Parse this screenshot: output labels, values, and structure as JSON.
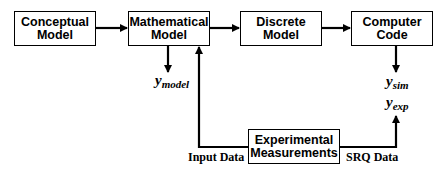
{
  "diagram": {
    "nodes": [
      {
        "id": "conceptual",
        "label": "Conceptual\nModel"
      },
      {
        "id": "mathematical",
        "label": "Mathematical\nModel"
      },
      {
        "id": "discrete",
        "label": "Discrete\nModel"
      },
      {
        "id": "computer",
        "label": "Computer\nCode"
      },
      {
        "id": "experimental",
        "label": "Experimental\nMeasurements"
      }
    ],
    "edges": [
      {
        "from": "conceptual",
        "to": "mathematical"
      },
      {
        "from": "mathematical",
        "to": "discrete"
      },
      {
        "from": "discrete",
        "to": "computer"
      },
      {
        "from": "mathematical",
        "to": "y_model"
      },
      {
        "from": "computer",
        "to": "y_sim"
      },
      {
        "from": "experimental",
        "to": "mathematical",
        "label": "Input Data"
      },
      {
        "from": "experimental",
        "to": "y_exp",
        "label": "SRQ Data"
      }
    ],
    "outputs": {
      "y_model": {
        "base": "y",
        "sub": "model"
      },
      "y_sim": {
        "base": "y",
        "sub": "sim"
      },
      "y_exp": {
        "base": "y",
        "sub": "exp"
      }
    },
    "labels": {
      "input_data": "Input Data",
      "srq_data": "SRQ Data"
    },
    "colors": {
      "line": "#000000",
      "background": "#ffffff"
    }
  }
}
